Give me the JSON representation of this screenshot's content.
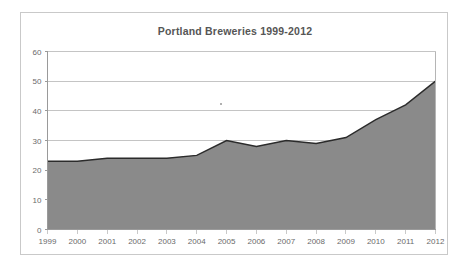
{
  "figure": {
    "background_color": "#ffffff",
    "border_color": "#c9c9c9",
    "stray_mark_name": "stray-speck"
  },
  "chart_data": {
    "type": "area",
    "title": "Portland Breweries 1999-2012",
    "xlabel": "",
    "ylabel": "",
    "categories": [
      "1999",
      "2000",
      "2001",
      "2002",
      "2003",
      "2004",
      "2005",
      "2006",
      "2007",
      "2008",
      "2009",
      "2010",
      "2011",
      "2012"
    ],
    "values": [
      23,
      23,
      24,
      24,
      24,
      25,
      30,
      28,
      30,
      29,
      31,
      37,
      42,
      50
    ],
    "series": [
      {
        "name": "Portland Breweries",
        "values": [
          23,
          23,
          24,
          24,
          24,
          25,
          30,
          28,
          30,
          29,
          31,
          37,
          42,
          50
        ]
      }
    ],
    "ylim": [
      0,
      60
    ],
    "yticks": [
      0,
      10,
      20,
      30,
      40,
      50,
      60
    ],
    "ytick_labels": [
      "0",
      "10",
      "20",
      "30",
      "40",
      "50",
      "60"
    ],
    "xtick_labels": [
      "1999",
      "2000",
      "2001",
      "2002",
      "2003",
      "2004",
      "2005",
      "2006",
      "2007",
      "2008",
      "2009",
      "2010",
      "2011",
      "2012"
    ],
    "grid": true,
    "grid_axis": "y",
    "legend": false,
    "legend_position": "none",
    "area_fill_color": "#8a8a8a",
    "line_color": "#2b2b2b",
    "grid_color": "#c4c4c4",
    "axis_color": "#9a9a9a",
    "tick_label_color": "#6a6a6a",
    "title_color": "#565656"
  }
}
